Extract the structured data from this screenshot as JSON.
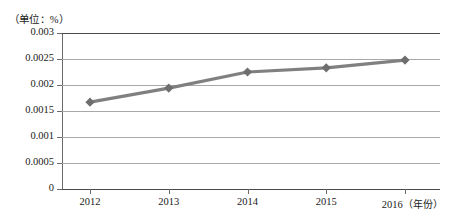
{
  "chart_data": {
    "type": "line",
    "title": "",
    "subtitle": "",
    "unit_caption": "（单位：%）",
    "xlabel": "（年份）",
    "ylabel": "",
    "categories": [
      "2012",
      "2013",
      "2014",
      "2015",
      "2016"
    ],
    "values": [
      0.00167,
      0.00194,
      0.00225,
      0.00233,
      0.00248
    ],
    "series": [
      {
        "name": "",
        "values": [
          0.00167,
          0.00194,
          0.00225,
          0.00233,
          0.00248
        ]
      }
    ],
    "ylim": [
      0,
      0.003
    ],
    "xlim": [
      "2012",
      "2016"
    ],
    "y_ticks": [
      "0.003",
      "0.0025",
      "0.002",
      "0.0015",
      "0.001",
      "0.0005",
      "0"
    ],
    "y_tick_values": [
      0.003,
      0.0025,
      0.002,
      0.0015,
      0.001,
      0.0005,
      0
    ],
    "grid": true,
    "grid_axis": "y",
    "legend": false,
    "legend_position": "none",
    "marker": "diamond",
    "line_color": "#808080",
    "marker_color": "#6e6e6e",
    "grid_color": "#a8a8a8",
    "axis_color": "#4a4a4a",
    "background": "#ffffff",
    "annotations": []
  },
  "axis": {
    "unit_caption": "（单位：%）",
    "x_axis_unit": "（年份）"
  }
}
